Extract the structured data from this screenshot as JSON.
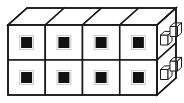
{
  "figure": {
    "type": "isometric-line-drawing",
    "caption": "",
    "stroke_color": "#1a1a1a",
    "fill_color": "#ffffff",
    "marker_color": "#111111",
    "background_color": "#ffffff",
    "stroke_width": "1.6",
    "thin_stroke_width": "1.0"
  },
  "geometry": {
    "front_face": {
      "label": "front-grid",
      "left": 8,
      "top": 25,
      "right": 157,
      "bottom": 95,
      "columns": 4,
      "rows": 2,
      "column_edges": [
        8,
        45.25,
        82.5,
        119.75,
        157
      ],
      "row_edges": [
        25,
        60,
        95
      ]
    },
    "depth_offset": {
      "dx": 19,
      "dy": -17
    },
    "top_face": {
      "label": "top-parallelograms",
      "count": 4
    },
    "side_face": {
      "label": "right-side-parallelogram",
      "handle_rows": 2,
      "handles_per_row": 2
    }
  },
  "front_cells": [
    {
      "name": "cell-r1-c1",
      "row": 1,
      "col": 1,
      "cx": 26.6,
      "cy": 42.5,
      "marker": "filled-square",
      "size": 11
    },
    {
      "name": "cell-r1-c2",
      "row": 1,
      "col": 2,
      "cx": 63.9,
      "cy": 42.5,
      "marker": "filled-square",
      "size": 11
    },
    {
      "name": "cell-r1-c3",
      "row": 1,
      "col": 3,
      "cx": 101.1,
      "cy": 42.5,
      "marker": "filled-square",
      "size": 11
    },
    {
      "name": "cell-r1-c4",
      "row": 1,
      "col": 4,
      "cx": 138.4,
      "cy": 42.5,
      "marker": "filled-square",
      "size": 11
    },
    {
      "name": "cell-r2-c1",
      "row": 2,
      "col": 1,
      "cx": 26.6,
      "cy": 77.5,
      "marker": "filled-square",
      "size": 11
    },
    {
      "name": "cell-r2-c2",
      "row": 2,
      "col": 2,
      "cx": 63.9,
      "cy": 77.5,
      "marker": "filled-square",
      "size": 11
    },
    {
      "name": "cell-r2-c3",
      "row": 2,
      "col": 3,
      "cx": 101.1,
      "cy": 77.5,
      "marker": "filled-square",
      "size": 11
    },
    {
      "name": "cell-r2-c4",
      "row": 2,
      "col": 4,
      "cx": 138.4,
      "cy": 77.5,
      "marker": "filled-square",
      "size": 11
    }
  ],
  "side_handles": [
    {
      "name": "side-handle-r1-near",
      "row": 1,
      "position": "near",
      "x": 160.5,
      "y": 35.0,
      "w": 7.5,
      "h": 10.0,
      "depth": 4.0
    },
    {
      "name": "side-handle-r1-far",
      "row": 1,
      "position": "far",
      "x": 170.0,
      "y": 26.5,
      "w": 7.5,
      "h": 10.0,
      "depth": 4.0
    },
    {
      "name": "side-handle-r2-near",
      "row": 2,
      "position": "near",
      "x": 160.5,
      "y": 69.5,
      "w": 7.5,
      "h": 10.0,
      "depth": 4.0
    },
    {
      "name": "side-handle-r2-far",
      "row": 2,
      "position": "far",
      "x": 170.0,
      "y": 61.0,
      "w": 7.5,
      "h": 10.0,
      "depth": 4.0
    }
  ],
  "labels": {
    "alt_text": "Line drawing of eight cube-shaped modules arranged four across and two high, drawn in isometric perspective with a dark square on each front face and small box handles on the right side."
  }
}
